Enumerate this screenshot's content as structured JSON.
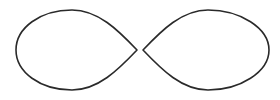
{
  "figure": {
    "stroke_color": "#2a2a2a",
    "background_color": "#ffffff",
    "stroke_width": 1.6,
    "shapes": [
      {
        "name": "left-lobe",
        "path": "M 137 50 C 118 30, 98 10, 72 10 C 40 10, 16 28, 16 50 C 16 72, 40 90, 72 90 C 98 90, 118 70, 137 50 Z"
      },
      {
        "name": "right-lobe",
        "path": "M 143 50 C 162 30, 182 10, 208 10 C 240 10, 269 28, 269 50 C 269 72, 240 90, 208 90 C 182 90, 162 70, 143 50 Z"
      }
    ]
  }
}
